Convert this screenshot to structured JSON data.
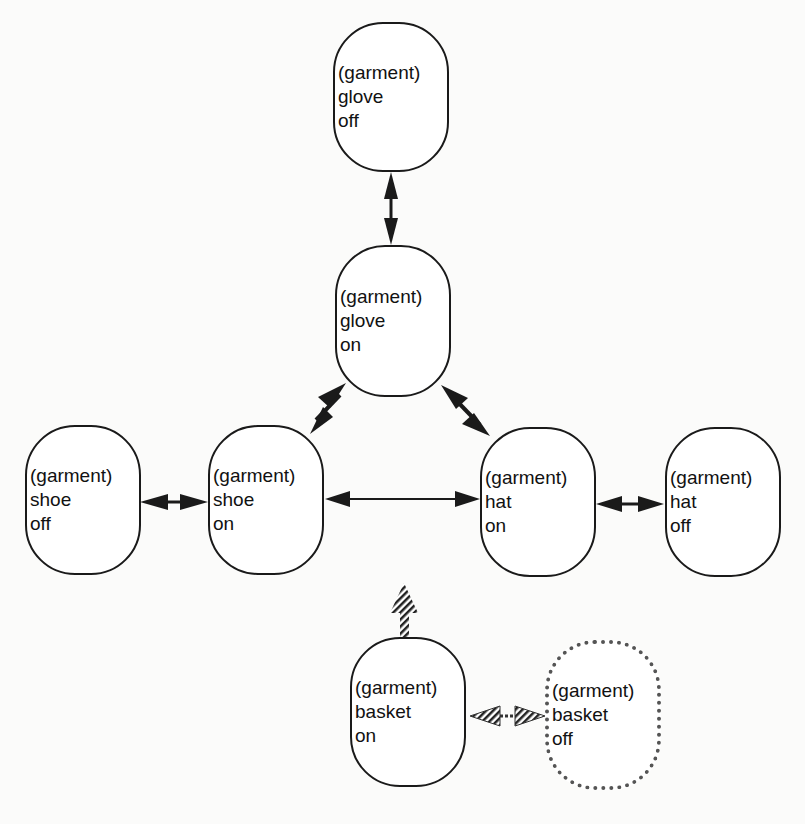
{
  "nodes": [
    {
      "id": "glove-off",
      "lines": [
        "(garment)",
        "glove",
        "off"
      ]
    },
    {
      "id": "glove-on",
      "lines": [
        "(garment)",
        "glove",
        "on"
      ]
    },
    {
      "id": "shoe-off",
      "lines": [
        "(garment)",
        "shoe",
        "off"
      ]
    },
    {
      "id": "shoe-on",
      "lines": [
        "(garment)",
        "shoe",
        "on"
      ]
    },
    {
      "id": "hat-on",
      "lines": [
        "(garment)",
        "hat",
        "on"
      ]
    },
    {
      "id": "hat-off",
      "lines": [
        "(garment)",
        "hat",
        "off"
      ]
    },
    {
      "id": "basket-on",
      "lines": [
        "(garment)",
        "basket",
        "on"
      ]
    },
    {
      "id": "basket-off",
      "lines": [
        "(garment)",
        "basket",
        "off"
      ],
      "style": "hatched"
    }
  ],
  "edges": [
    {
      "from": "glove-off",
      "to": "glove-on",
      "type": "bidirectional"
    },
    {
      "from": "glove-on",
      "to": "shoe-on",
      "type": "bidirectional"
    },
    {
      "from": "glove-on",
      "to": "hat-on",
      "type": "bidirectional"
    },
    {
      "from": "shoe-off",
      "to": "shoe-on",
      "type": "bidirectional"
    },
    {
      "from": "shoe-on",
      "to": "hat-on",
      "type": "bidirectional-thin"
    },
    {
      "from": "hat-on",
      "to": "hat-off",
      "type": "bidirectional"
    },
    {
      "from": "basket-on",
      "to": "up",
      "type": "hatched-arrow"
    },
    {
      "from": "basket-on",
      "to": "basket-off",
      "type": "hatched-bidirectional"
    }
  ]
}
